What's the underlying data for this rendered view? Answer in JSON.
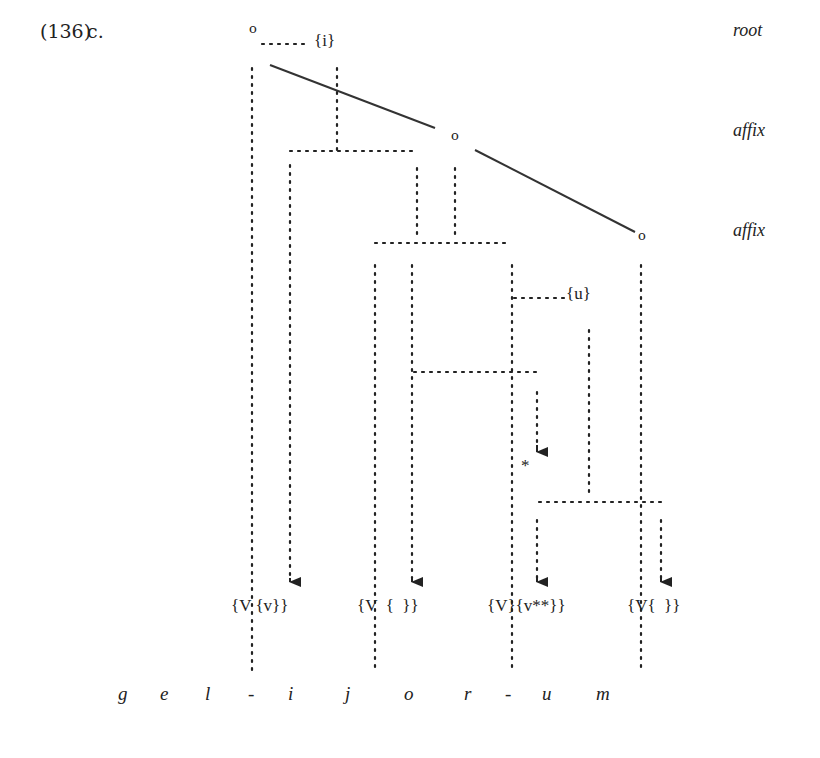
{
  "example": {
    "number": "(136)",
    "letter": "c."
  },
  "tiers": [
    {
      "label": "root",
      "y": 30
    },
    {
      "label": "affix",
      "y": 130
    },
    {
      "label": "affix",
      "y": 230
    }
  ],
  "nodes": [
    {
      "label": "o",
      "x": 249,
      "y": 21
    },
    {
      "label": "o",
      "x": 451,
      "y": 128
    },
    {
      "label": "o",
      "x": 638,
      "y": 228
    }
  ],
  "annotations": [
    {
      "label": "{i}",
      "x": 316,
      "y": 32
    },
    {
      "label": "{u}",
      "x": 568,
      "y": 284
    },
    {
      "label": "*",
      "x": 521,
      "y": 458
    }
  ],
  "feature_bundles": [
    {
      "label": "{V {v}}",
      "x": 232,
      "y": 596
    },
    {
      "label": "{V  {  }}",
      "x": 357,
      "y": 596
    },
    {
      "label": "{V}{v**}}",
      "x": 488,
      "y": 596
    },
    {
      "label": "{V{  }}",
      "x": 628,
      "y": 596
    }
  ],
  "segments": [
    {
      "label": "g",
      "x": 118
    },
    {
      "label": "e",
      "x": 160
    },
    {
      "label": "l",
      "x": 205
    },
    {
      "label": "-",
      "x": 248
    },
    {
      "label": "i",
      "x": 286
    },
    {
      "label": "j",
      "x": 345
    },
    {
      "label": "o",
      "x": 404
    },
    {
      "label": "r",
      "x": 463
    },
    {
      "label": "-",
      "x": 503
    },
    {
      "label": "u",
      "x": 542
    },
    {
      "label": "m",
      "x": 596
    }
  ]
}
